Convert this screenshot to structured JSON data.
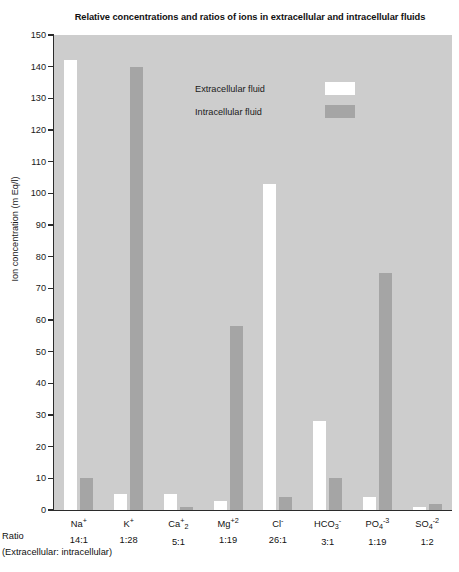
{
  "chart_data": {
    "type": "bar",
    "title": "Relative concentrations and ratios of ions in extracellular and intracellular fluids",
    "xlabel": "",
    "ylabel": "Ion concentration (m Eq/l)",
    "ylim": [
      0,
      150
    ],
    "ytick_step": 10,
    "yticks": [
      0,
      10,
      20,
      30,
      40,
      50,
      60,
      70,
      80,
      90,
      100,
      110,
      120,
      130,
      140,
      150
    ],
    "grid": false,
    "legend_position": "upper-center",
    "categories": [
      "Na+",
      "K+",
      "Ca+2",
      "Mg+2",
      "Cl-",
      "HCO3-",
      "PO4-3",
      "SO4-2"
    ],
    "category_labels_html": [
      "Na<sup>+</sup>",
      "K<sup>+</sup>",
      "Ca<sup>+</sup><sub>2</sub>",
      "Mg<sup>+2</sup>",
      "Cl<sup>-</sup>",
      "HCO<sub>3</sub><sup>-</sup>",
      "PO<sub>4</sub><sup>-3</sup>",
      "SO<sub>4</sub><sup>-2</sup>"
    ],
    "ratios": [
      "14:1",
      "1:28",
      "5:1",
      "1:19",
      "26:1",
      "3:1",
      "1:19",
      "1:2"
    ],
    "series": [
      {
        "name": "Extracellular fluid",
        "color": "#ffffff",
        "values": [
          142,
          5,
          5,
          3,
          103,
          28,
          4,
          1
        ]
      },
      {
        "name": "Intracellular fluid",
        "color": "#a5a5a5",
        "values": [
          10,
          140,
          1,
          58,
          4,
          10,
          75,
          2
        ]
      }
    ]
  },
  "axes": {
    "y_title": "Ion concentration (m Eq/l)"
  },
  "legend": {
    "items": [
      {
        "label": "Extracellular fluid",
        "swatch": "#ffffff"
      },
      {
        "label": "Intracellular fluid",
        "swatch": "#a5a5a5"
      }
    ]
  },
  "footer": {
    "ratio_label": "Ratio",
    "ratio_caption": "(Extracellular: intracellular)"
  },
  "style": {
    "plot_background": "#cdcdcd",
    "page_background": "#ffffff",
    "axis_color": "#2b2b2b",
    "text_color": "#111111"
  }
}
